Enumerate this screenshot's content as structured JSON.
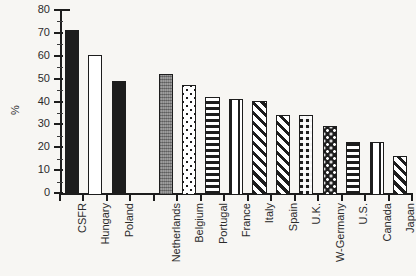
{
  "chart_data": {
    "type": "bar",
    "title": "",
    "xlabel": "",
    "ylabel": "%",
    "ylim": [
      0,
      80
    ],
    "ytick_step": 10,
    "yticks": [
      "0",
      "10",
      "20",
      "30",
      "40",
      "50",
      "60",
      "70",
      "80"
    ],
    "grid": false,
    "legend": "none",
    "categories": [
      "CSFR",
      "Hungary",
      "Poland",
      "Netherlands",
      "Belgium",
      "Portugal",
      "France",
      "Italy",
      "Spain",
      "U.K.",
      "W-Germany",
      "U.S.",
      "Canada",
      "Japan"
    ],
    "values": [
      72,
      61,
      50,
      53,
      48,
      43,
      42,
      41,
      35,
      35,
      30,
      23,
      23,
      17
    ],
    "bar_fills": [
      "solid-black",
      "white",
      "solid-black",
      "gray",
      "dots",
      "horizontal-lines",
      "vertical-lines",
      "diagonal-stripes",
      "diagonal-stripes",
      "checkered",
      "grid-dots",
      "horizontal-lines",
      "vertical-lines",
      "diagonal-stripes"
    ],
    "group_gap_after_index": 2
  },
  "style": {
    "background": "#f7f6f3",
    "axis_color": "#1d1d1d",
    "text_color": "#2b2b2b",
    "bar_outline": "#1d1d1d",
    "gray_fill": "#8a8a8a"
  }
}
